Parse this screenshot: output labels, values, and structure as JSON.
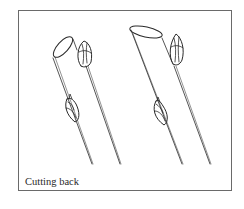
{
  "figure": {
    "caption": "Cutting back",
    "illustration": {
      "subject": "two pruned plant stems with buds",
      "items": [
        {
          "name": "left-stem",
          "description": "stem cut straight just above a bud"
        },
        {
          "name": "right-stem",
          "description": "stem cut at a slant above a bud"
        }
      ]
    },
    "colors": {
      "line": "#2a2a2a",
      "border": "#6a6a6a",
      "background": "#ffffff"
    }
  }
}
